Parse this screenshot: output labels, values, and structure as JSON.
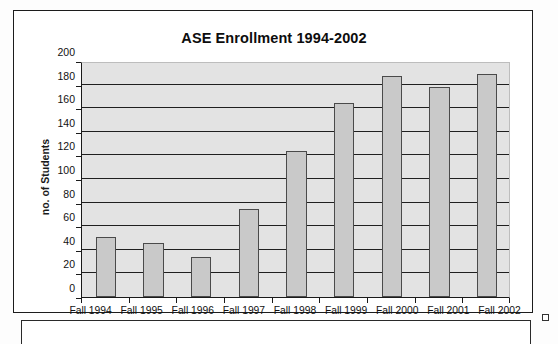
{
  "chart_data": {
    "type": "bar",
    "title": "ASE Enrollment 1994-2002",
    "xlabel": "",
    "ylabel": "no. of Students",
    "categories": [
      "Fall 1994",
      "Fall 1995",
      "Fall 1996",
      "Fall 1997",
      "Fall 1998",
      "Fall 1999",
      "Fall 2000",
      "Fall 2001",
      "Fall 2002"
    ],
    "values": [
      51,
      46,
      34,
      75,
      124,
      164,
      187,
      178,
      189
    ],
    "ylim": [
      0,
      200
    ],
    "yticks": [
      0,
      20,
      40,
      60,
      80,
      100,
      120,
      140,
      160,
      180,
      200
    ],
    "ytick_labels": [
      "0",
      "20",
      "40",
      "60",
      "80",
      "100",
      "120",
      "140",
      "160",
      "180",
      "200"
    ],
    "grid": true,
    "legend": false,
    "legend_position": "none",
    "bar_fill": "#c9c9c9",
    "bar_border": "#4a4a4a",
    "plot_background": "#e3e3e3"
  },
  "page": {
    "background": "#ffffff",
    "frame_border_color": "#1c1c1c"
  }
}
